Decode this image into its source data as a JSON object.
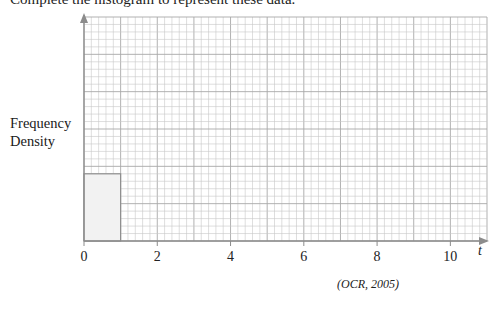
{
  "question": {
    "instruction": "Complete the histogram to represent these data.",
    "source": "(OCR, 2005)"
  },
  "chart_data": {
    "type": "bar",
    "title": "",
    "xlabel": "t",
    "ylabel": "Frequency Density",
    "x_ticks": [
      0,
      2,
      4,
      6,
      8,
      10
    ],
    "xlim": [
      0,
      11
    ],
    "grid": true,
    "grid_minor_per_unit": 5,
    "bars": [
      {
        "x_start": 0,
        "x_end": 1,
        "height_grid_squares": 9,
        "fill": "#f2f2f2"
      }
    ],
    "note": "Only the first bar (0 to 1) is drawn; y-axis has no numeric scale. Grid is 11 units wide, 30 minor squares tall."
  },
  "labels": {
    "ylabel_line1": "Frequency",
    "ylabel_line2": "Density",
    "xlabel": "t",
    "ticks": [
      "0",
      "2",
      "4",
      "6",
      "8",
      "10"
    ]
  },
  "colors": {
    "grid_minor": "#c8c8c8",
    "grid_major": "#a8a8a8",
    "axis": "#8c8c8c",
    "bar_fill": "#f2f2f2",
    "bar_edge": "#8c8c8c"
  }
}
